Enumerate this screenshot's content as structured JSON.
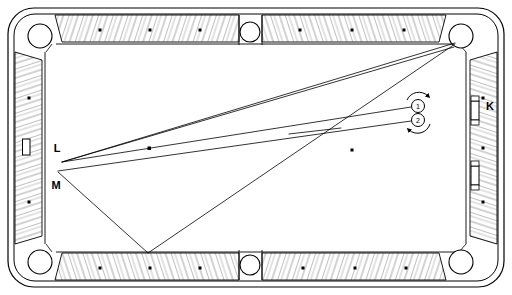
{
  "diagram": {
    "surface_color": "#ffffff",
    "line_color": "#000000",
    "rail_fill": "#ffffff",
    "cloth_fill": "#ffffff"
  },
  "labels": [
    {
      "id": "label-K",
      "text": "K",
      "x": 490,
      "y": 110
    },
    {
      "id": "label-L",
      "text": "L",
      "x": 57,
      "y": 152
    },
    {
      "id": "label-M",
      "text": "M",
      "x": 56,
      "y": 189
    }
  ],
  "balls": [
    {
      "id": "ball-1",
      "number": "1",
      "cx": 418,
      "cy": 106,
      "r": 6.5
    },
    {
      "id": "ball-2",
      "number": "2",
      "cx": 418,
      "cy": 120,
      "r": 6.5
    }
  ],
  "spin_arrows": [
    {
      "id": "spin-arrow-top",
      "description": "clockwise-arc-above-balls"
    },
    {
      "id": "spin-arrow-bottom",
      "description": "counterclockwise-arc-below-balls"
    }
  ],
  "pockets": [
    {
      "id": "pocket-top-left",
      "cx": 40,
      "cy": 36,
      "r": 12
    },
    {
      "id": "pocket-top-middle",
      "cx": 250,
      "cy": 32,
      "r": 10
    },
    {
      "id": "pocket-top-right",
      "cx": 461,
      "cy": 36,
      "r": 12
    },
    {
      "id": "pocket-bottom-left",
      "cx": 40,
      "cy": 262,
      "r": 12
    },
    {
      "id": "pocket-bottom-middle",
      "cx": 250,
      "cy": 265,
      "r": 10
    },
    {
      "id": "pocket-bottom-right",
      "cx": 461,
      "cy": 262,
      "r": 12
    }
  ],
  "rail_sights": [
    {
      "id": "sight-left-rail",
      "x": 22,
      "y": 139,
      "w": 7,
      "h": 16
    },
    {
      "id": "sight-right-rail-upper",
      "x": 468,
      "y": 103,
      "w": 7,
      "h": 16
    },
    {
      "id": "sight-right-rail-lower",
      "x": 468,
      "y": 166,
      "w": 7,
      "h": 16
    }
  ],
  "rail_dots": [
    {
      "x": 100,
      "y": 30
    },
    {
      "x": 150,
      "y": 30
    },
    {
      "x": 200,
      "y": 30
    },
    {
      "x": 300,
      "y": 30
    },
    {
      "x": 352,
      "y": 30
    },
    {
      "x": 404,
      "y": 30
    },
    {
      "x": 100,
      "y": 268
    },
    {
      "x": 150,
      "y": 268
    },
    {
      "x": 200,
      "y": 268
    },
    {
      "x": 303,
      "y": 268
    },
    {
      "x": 355,
      "y": 268
    },
    {
      "x": 406,
      "y": 268
    },
    {
      "x": 35,
      "y": 98
    },
    {
      "x": 35,
      "y": 202
    },
    {
      "x": 472,
      "y": 98
    },
    {
      "x": 472,
      "y": 148
    },
    {
      "x": 472,
      "y": 202
    }
  ],
  "table_spots": [
    {
      "id": "spot-left",
      "x": 149,
      "y": 148
    },
    {
      "id": "spot-center-right",
      "x": 352,
      "y": 150
    }
  ],
  "trajectories": [
    {
      "id": "path-L-to-corner-upper",
      "description": "long line from L area to top-right corner pocket",
      "points": "62,162 456,43"
    },
    {
      "id": "path-L-to-corner-lower",
      "description": "second long line from L area to top-right corner pocket",
      "points": "62,162 456,46"
    },
    {
      "id": "path-ball1-left",
      "description": "line from ball 1 running left and slightly down",
      "points": "411,107 62,162"
    },
    {
      "id": "path-ball2-left",
      "description": "line from ball 2 running left toward M area",
      "points": "411,121 58,170"
    },
    {
      "id": "path-M-to-bottom-cushion",
      "description": "line from M down-right to bottom cushion",
      "points": "58,172 148,254"
    },
    {
      "id": "path-bottom-cushion-to-corner",
      "description": "line from bottom cushion up-right to top-right pocket",
      "points": "148,254 456,44"
    },
    {
      "id": "path-short-segment-mid",
      "description": "short tangent segment near table centre",
      "points": "290,133 341,128"
    }
  ]
}
